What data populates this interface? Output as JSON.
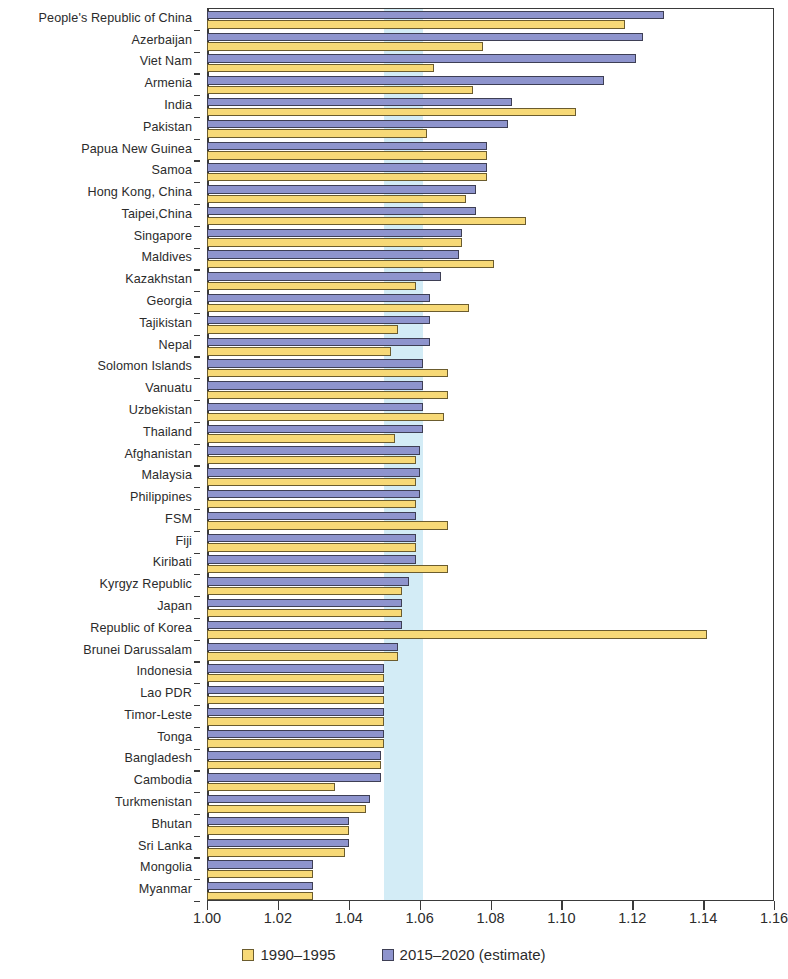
{
  "chart_data": {
    "type": "bar",
    "orientation": "horizontal",
    "title": "",
    "subtitle": "",
    "xlabel": "",
    "ylabel": "",
    "xlim": [
      1.0,
      1.16
    ],
    "xticks": [
      1.0,
      1.02,
      1.04,
      1.06,
      1.08,
      1.1,
      1.12,
      1.14,
      1.16
    ],
    "xtick_labels": [
      "1.00",
      "1.02",
      "1.04",
      "1.06",
      "1.08",
      "1.10",
      "1.12",
      "1.14",
      "1.16"
    ],
    "grid": false,
    "legend_position": "bottom",
    "highlight_band": {
      "label": "",
      "from": 1.05,
      "to": 1.061,
      "color": "#cbe9f4"
    },
    "series": [
      {
        "name": "1990–1995",
        "key": "past",
        "color": "#f7d977"
      },
      {
        "name": "2015–2020 (estimate)",
        "key": "recent",
        "color": "#8e94cd"
      }
    ],
    "categories": [
      "People's Republic of China",
      "Azerbaijan",
      "Viet Nam",
      "Armenia",
      "India",
      "Pakistan",
      "Papua New Guinea",
      "Samoa",
      "Hong Kong, China",
      "Taipei,China",
      "Singapore",
      "Maldives",
      "Kazakhstan",
      "Georgia",
      "Tajikistan",
      "Nepal",
      "Solomon Islands",
      "Vanuatu",
      "Uzbekistan",
      "Thailand",
      "Afghanistan",
      "Malaysia",
      "Philippines",
      "FSM",
      "Fiji",
      "Kiribati",
      "Kyrgyz Republic",
      "Japan",
      "Republic of Korea",
      "Brunei Darussalam",
      "Indonesia",
      "Lao PDR",
      "Timor-Leste",
      "Tonga",
      "Bangladesh",
      "Cambodia",
      "Turkmenistan",
      "Bhutan",
      "Sri Lanka",
      "Mongolia",
      "Myanmar"
    ],
    "values": {
      "recent": [
        1.129,
        1.123,
        1.121,
        1.112,
        1.086,
        1.085,
        1.079,
        1.079,
        1.076,
        1.076,
        1.072,
        1.071,
        1.066,
        1.063,
        1.063,
        1.063,
        1.061,
        1.061,
        1.061,
        1.061,
        1.06,
        1.06,
        1.06,
        1.059,
        1.059,
        1.059,
        1.057,
        1.055,
        1.055,
        1.054,
        1.05,
        1.05,
        1.05,
        1.05,
        1.049,
        1.049,
        1.046,
        1.04,
        1.04,
        1.03,
        1.03
      ],
      "past": [
        1.118,
        1.078,
        1.064,
        1.075,
        1.104,
        1.062,
        1.079,
        1.079,
        1.073,
        1.09,
        1.072,
        1.081,
        1.059,
        1.074,
        1.054,
        1.052,
        1.068,
        1.068,
        1.067,
        1.053,
        1.059,
        1.059,
        1.059,
        1.068,
        1.059,
        1.068,
        1.055,
        1.055,
        1.141,
        1.054,
        1.05,
        1.05,
        1.05,
        1.05,
        1.049,
        1.036,
        1.045,
        1.04,
        1.039,
        1.03,
        1.03
      ]
    }
  },
  "legend": {
    "items": [
      {
        "label": "1990–1995",
        "key": "past"
      },
      {
        "label": "2015–2020 (estimate)",
        "key": "recent"
      }
    ]
  }
}
